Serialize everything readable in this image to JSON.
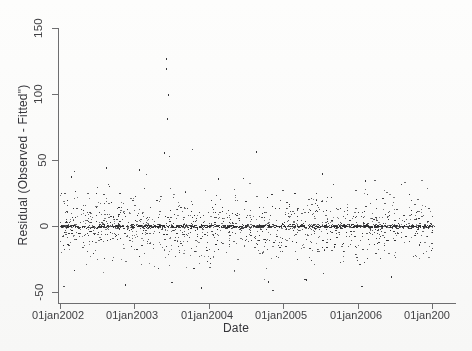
{
  "chart_data": {
    "type": "scatter",
    "title": "",
    "xlabel": "Date",
    "ylabel": "Residual (Observed - Fitted\")",
    "ylim": [
      -60,
      160
    ],
    "yticks": [
      -50,
      0,
      50,
      100,
      150
    ],
    "ytick_labels": [
      "-50",
      "0",
      "50",
      "100",
      "150"
    ],
    "xticks": [
      2002,
      2003,
      2004,
      2005,
      2006,
      2007
    ],
    "xtick_labels": [
      "01jan2002",
      "01jan2003",
      "01jan2004",
      "01jan2005",
      "01jan2006",
      "01jan200"
    ],
    "xlim": [
      2001.92,
      2007.25
    ],
    "grid": false,
    "legend": null,
    "marker": "dot",
    "marker_color": "#2b2b2e",
    "marker_size": 1,
    "axis_color": "#6e6e70",
    "background": "#fbfbfa",
    "series": [
      {
        "name": "residuals",
        "n_points": 1640,
        "center": 0,
        "spread_sd": 11.5,
        "notable_outliers": [
          {
            "x": 2003.42,
            "y": 127
          },
          {
            "x": 2003.42,
            "y": 120
          },
          {
            "x": 2003.45,
            "y": 100
          },
          {
            "x": 2003.44,
            "y": 82
          },
          {
            "x": 2003.4,
            "y": 56
          },
          {
            "x": 2004.63,
            "y": 57
          },
          {
            "x": 2002.62,
            "y": 45
          },
          {
            "x": 2003.06,
            "y": 43
          },
          {
            "x": 2005.52,
            "y": 40
          },
          {
            "x": 2002.15,
            "y": 38
          },
          {
            "x": 2004.12,
            "y": 36
          },
          {
            "x": 2006.1,
            "y": 35
          },
          {
            "x": 2002.88,
            "y": -44
          },
          {
            "x": 2003.9,
            "y": -46
          },
          {
            "x": 2004.8,
            "y": -42
          },
          {
            "x": 2005.3,
            "y": -40
          },
          {
            "x": 2006.45,
            "y": -38
          }
        ]
      }
    ]
  }
}
